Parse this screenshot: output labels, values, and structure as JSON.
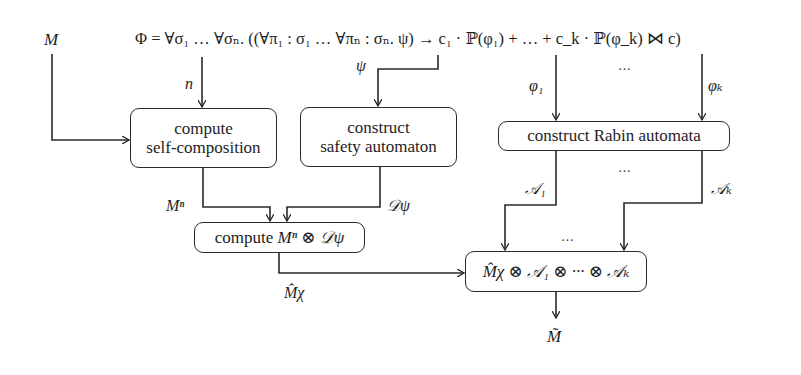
{
  "diagram": {
    "type": "flowchart",
    "inputs": {
      "model_label": "M",
      "formula": "Φ = ∀σ₁ … ∀σₙ. ((∀π₁ : σ₁ … ∀πₙ : σₙ. ψ) → c₁ · ℙ(φ₁) + … + c_k · ℙ(φ_k) ⋈ c)"
    },
    "edge_labels": {
      "n": "n",
      "psi": "ψ",
      "phi1": "φ₁",
      "phik": "φₖ",
      "Mn": "Mⁿ",
      "Dpsi": "𝒟ψ",
      "A1": "𝒜₁",
      "Ak": "𝒜ₖ",
      "Mchi": "M̂χ",
      "ellipsis_top": "…",
      "ellipsis_mid": "…",
      "ellipsis_bottom": "…"
    },
    "nodes": {
      "self_composition": {
        "line1": "compute",
        "line2": "self-composition"
      },
      "safety_automaton": {
        "line1": "construct",
        "line2": "safety automaton"
      },
      "rabin": {
        "label": "construct Rabin automata"
      },
      "product_safety": {
        "prefix": "compute ",
        "expr": "Mⁿ ⊗ 𝒟ψ"
      },
      "final_product": {
        "expr": "M̂χ ⊗ 𝒜₁ ⊗ ··· ⊗ 𝒜ₖ"
      }
    },
    "output": {
      "label": "M̃"
    },
    "colors": {
      "stroke": "#2a2a2a",
      "text": "#1e1e1e",
      "background": "#ffffff"
    }
  }
}
